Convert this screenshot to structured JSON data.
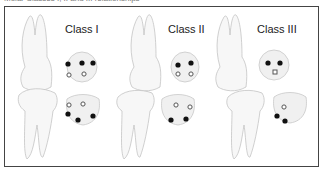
{
  "caption": "Molar Classes I, II and III relationships",
  "colors": {
    "frame_border": "#444444",
    "tooth_outline": "#bdbdbd",
    "crown_fill": "#f2f2f2",
    "contact_filled": "#111111",
    "contact_open": "#666666"
  },
  "panels": [
    {
      "label": "Class I",
      "upper_crown": {
        "filled_points": 3,
        "open_points": 2
      },
      "lower_crown": {
        "filled_points": 3,
        "open_points": 2
      }
    },
    {
      "label": "Class II",
      "upper_crown": {
        "filled_points": 2,
        "open_points": 2
      },
      "lower_crown": {
        "filled_points": 2,
        "open_points": 2
      }
    },
    {
      "label": "Class III",
      "upper_crown": {
        "filled_points": 2,
        "open_points": 1
      },
      "lower_crown": {
        "filled_points": 2,
        "open_points": 1
      }
    }
  ]
}
